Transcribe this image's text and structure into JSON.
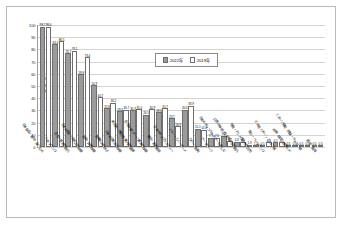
{
  "chart_data": {
    "type": "bar",
    "title": "",
    "xlabel": "",
    "ylabel": "割合・％",
    "ylim": [
      0,
      100
    ],
    "yticks": [
      100,
      90,
      80,
      70,
      60,
      50,
      40,
      30,
      20,
      10,
      0
    ],
    "grid": true,
    "legend_position": "top-center",
    "categories": [
      "日本食品・食材・食べもの",
      "ショッピング",
      "自然・景勝地観光",
      "日本の歴史・伝統文化体験",
      "温泉・旅館体験",
      "繁華街の街歩き",
      "日本の日常生活体験",
      "美術館・博物館・動植物園等",
      "自然体験ツアー・農漁村体験",
      "舞台・音楽鑑賞",
      "日本のポップカルチャー",
      "スキー・スノーボード",
      "スポーツ観戦",
      "テーマパーク",
      "日本のポップカルチャーを楽しむ",
      "四季の体感・花見等の季節観光",
      "映画・アニメ縁の地を訪問",
      "登山・トレッキング",
      "その他スポーツ（ゴルフ等）",
      "治療・検診・健康ケア",
      "スポーツ観戦（相撲・サッカー等）",
      "語学・教育"
    ],
    "series": [
      {
        "name": "2022年",
        "color": "#9b9b9b",
        "values": [
          98.7,
          84.4,
          76.7,
          59.8,
          50.9,
          31.8,
          29.4,
          30.3,
          26.5,
          28.6,
          23.7,
          30.5,
          15.1,
          7.7,
          9.2,
          4.3,
          1.9,
          0.5,
          4.1,
          0.5,
          0.5,
          0.5
        ]
      },
      {
        "name": "2019年",
        "color": "#ffffff",
        "values": [
          98.6,
          86.5,
          79.1,
          73.4,
          40.7,
          36.2,
          30.7,
          31.0,
          30.9,
          31.7,
          16.9,
          33.9,
          14.1,
          7.6,
          4.7,
          3.9,
          1.2,
          4.1,
          4.1,
          0.5,
          0.5,
          0.5
        ]
      }
    ],
    "value_labels_2022": [
      "98.7",
      "84.4",
      "76.7",
      "59.8",
      "50.9",
      "31.8",
      "29.4",
      "30.3",
      "26.5",
      "28.6",
      "23.7",
      "30.5",
      "15.1",
      "7.7",
      "9.2",
      "4.3",
      "1.9",
      "0.5",
      "4.1",
      "0.5",
      "0.5",
      "0.5"
    ],
    "value_labels_2019": [
      "98.6",
      "86.5",
      "79.1",
      "73.4",
      "40.7",
      "36.2",
      "30.7",
      "31.0",
      "30.9",
      "31.7",
      "16.9",
      "33.9",
      "14.1",
      "7.6",
      "4.7",
      "3.9",
      "1.2",
      "4.1",
      "4.1",
      "0.5",
      "0.5",
      "0.5"
    ]
  },
  "legend": {
    "items": [
      {
        "label": "2022年"
      },
      {
        "label": "2019年"
      }
    ]
  }
}
